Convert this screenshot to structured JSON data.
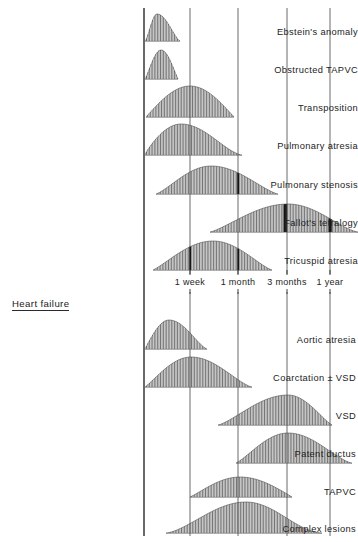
{
  "figure": {
    "title": "",
    "axis_origin_label": "birth"
  },
  "sections": [
    {
      "name": "cyanosis-section",
      "heading": "",
      "heading_visible": false
    },
    {
      "name": "heart-failure-section",
      "heading": "Heart failure",
      "heading_visible": true
    }
  ],
  "axis": {
    "ticks": [
      {
        "label": "1 week",
        "x": 190
      },
      {
        "label": "1 month",
        "x": 238
      },
      {
        "label": "3 months",
        "x": 287
      },
      {
        "label": "1 year",
        "x": 330
      }
    ],
    "baseline_x": 144,
    "label_row_y": 277
  },
  "chart_data": {
    "type": "area",
    "xlabel": "Age (log scale: birth to 1 year)",
    "ylabel": "Relative frequency of presentation",
    "xlim": [
      144,
      358
    ],
    "grid": true,
    "legend": "none",
    "x_tick_labels": [
      "1 week",
      "1 month",
      "3 months",
      "1 year"
    ],
    "x_tick_positions": [
      190,
      238,
      287,
      330
    ],
    "series": [
      {
        "name": "Ebstein's anomaly",
        "group": "cyanosis",
        "label_y": 33,
        "baseline_y": 41,
        "start": 145,
        "end": 180,
        "peak": 157,
        "height": 27,
        "left_shape": 1.5,
        "right_shape": 1.4
      },
      {
        "name": "Obstructed TAPVC",
        "group": "cyanosis",
        "label_y": 71,
        "baseline_y": 79,
        "start": 145,
        "end": 178,
        "peak": 161,
        "height": 29,
        "left_shape": 1.2,
        "right_shape": 1.1
      },
      {
        "name": "Transposition",
        "group": "cyanosis",
        "label_y": 109,
        "baseline_y": 117,
        "start": 146,
        "end": 234,
        "peak": 190,
        "height": 31,
        "left_shape": 1.0,
        "right_shape": 1.0
      },
      {
        "name": "Pulmonary atresia",
        "group": "cyanosis",
        "label_y": 147,
        "baseline_y": 155,
        "start": 145,
        "end": 242,
        "peak": 181,
        "height": 31,
        "left_shape": 0.85,
        "right_shape": 1.5
      },
      {
        "name": "Pulmonary stenosis",
        "group": "cyanosis",
        "label_y": 186,
        "baseline_y": 194,
        "start": 156,
        "end": 278,
        "peak": 211,
        "height": 28,
        "left_shape": 1.25,
        "right_shape": 1.3,
        "markers": [
          238
        ]
      },
      {
        "name": "Fallot's tetralogy",
        "group": "cyanosis",
        "label_y": 224,
        "baseline_y": 232,
        "start": 210,
        "end": 358,
        "peak": 288,
        "height": 28,
        "left_shape": 1.25,
        "right_shape": 1.4,
        "markers": [
          285,
          330
        ]
      },
      {
        "name": "Tricuspid atresia",
        "group": "cyanosis",
        "label_y": 262,
        "baseline_y": 270,
        "start": 153,
        "end": 272,
        "peak": 213,
        "height": 29,
        "left_shape": 1.15,
        "right_shape": 1.25,
        "markers": [
          190,
          238
        ]
      },
      {
        "name": "Aortic atresia",
        "group": "heart-failure",
        "label_y": 341,
        "baseline_y": 349,
        "start": 145,
        "end": 207,
        "peak": 169,
        "height": 29,
        "left_shape": 1.0,
        "right_shape": 1.35
      },
      {
        "name": "Coarctation ± VSD",
        "group": "heart-failure",
        "label_y": 379,
        "baseline_y": 387,
        "start": 145,
        "end": 252,
        "peak": 191,
        "height": 30,
        "left_shape": 1.1,
        "right_shape": 1.35
      },
      {
        "name": "VSD",
        "group": "heart-failure",
        "label_y": 417,
        "baseline_y": 425,
        "start": 218,
        "end": 332,
        "peak": 288,
        "height": 30,
        "left_shape": 1.3,
        "right_shape": 1.2
      },
      {
        "name": "Patent ductus",
        "group": "heart-failure",
        "label_y": 455,
        "baseline_y": 463,
        "start": 236,
        "end": 352,
        "peak": 288,
        "height": 30,
        "left_shape": 1.2,
        "right_shape": 1.4
      },
      {
        "name": "TAPVC",
        "group": "heart-failure",
        "label_y": 493,
        "baseline_y": 497,
        "start": 190,
        "end": 292,
        "peak": 240,
        "height": 20,
        "left_shape": 1.1,
        "right_shape": 1.0
      },
      {
        "name": "Complex lesions",
        "group": "heart-failure",
        "label_y": 530,
        "baseline_y": 533,
        "start": 166,
        "end": 322,
        "peak": 246,
        "height": 31,
        "left_shape": 1.5,
        "right_shape": 1.8
      }
    ]
  },
  "labels": {
    "row_0": "Ebstein's anomaly",
    "row_1": "Obstructed TAPVC",
    "row_2": "Transposition",
    "row_3": "Pulmonary atresia",
    "row_4": "Pulmonary stenosis",
    "row_5": "Fallot's tetralogy",
    "row_6": "Tricuspid atresia",
    "heart_failure_heading": "Heart failure",
    "row_7": "Aortic atresia",
    "row_8": "Coarctation ± VSD",
    "row_9": "VSD",
    "row_10": "Patent ductus",
    "row_11": "TAPVC",
    "row_12": "Complex lesions"
  },
  "colors": {
    "ink": "#1b1b1b",
    "hatch": "#6e6e6e",
    "gridline": "#5a5a5a",
    "axis": "#2a2a2a",
    "background": "#ffffff"
  }
}
